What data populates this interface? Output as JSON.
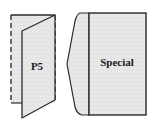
{
  "diagram": {
    "items": [
      {
        "id": "p5",
        "label": "P5",
        "style": "folded-leaflet-dashed"
      },
      {
        "id": "special",
        "label": "Special",
        "style": "page-with-pointed-flap"
      }
    ],
    "colors": {
      "paper_fill": "#e6e6e6",
      "outline": "#2a2a2a",
      "background": "#ffffff"
    }
  }
}
